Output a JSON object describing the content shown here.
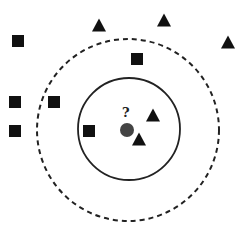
{
  "diagram": {
    "query_label": "?",
    "colors": {
      "background": "#ffffff",
      "shape_fill": "#111111",
      "query_point": "#444444",
      "circle_stroke": "#222222"
    },
    "query_point": {
      "x": 127,
      "y": 130,
      "r": 7
    },
    "inner_circle": {
      "cx": 129,
      "cy": 129,
      "r": 51,
      "style": "solid",
      "label": "k=3"
    },
    "outer_circle": {
      "cx": 128,
      "cy": 130,
      "r": 91,
      "style": "dashed",
      "label": "k=5"
    },
    "squares": [
      {
        "x": 18,
        "y": 41
      },
      {
        "x": 137,
        "y": 59
      },
      {
        "x": 15,
        "y": 102
      },
      {
        "x": 54,
        "y": 102
      },
      {
        "x": 15,
        "y": 131
      },
      {
        "x": 89,
        "y": 131
      }
    ],
    "triangles": [
      {
        "x": 99,
        "y": 25
      },
      {
        "x": 164,
        "y": 20
      },
      {
        "x": 228,
        "y": 42
      },
      {
        "x": 153,
        "y": 115
      },
      {
        "x": 139,
        "y": 139
      }
    ]
  }
}
